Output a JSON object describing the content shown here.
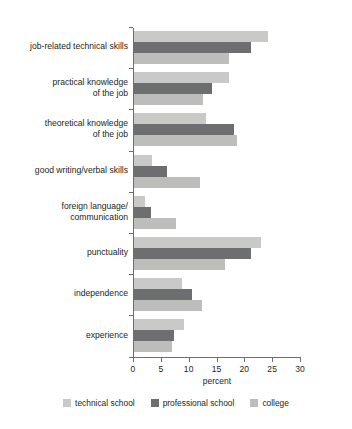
{
  "chart_data": {
    "type": "bar",
    "orientation": "horizontal",
    "title": "",
    "xlabel": "percent",
    "ylabel": "",
    "xlim": [
      0,
      30
    ],
    "xticks": [
      0,
      5,
      10,
      15,
      20,
      25,
      30
    ],
    "xtick_labels": [
      "0",
      "5",
      "10",
      "15",
      "20",
      "25",
      "30"
    ],
    "grid": false,
    "legend_position": "bottom",
    "categories": [
      "job-related technical skills",
      "practical knowledge\nof the job",
      "theoretical knowledge\nof the job",
      "good writing/verbal skills",
      "foreign language/\ncommunication",
      "punctuality",
      "independence",
      "experience"
    ],
    "series": [
      {
        "name": "technical school",
        "color": "#c9c9c7",
        "values": [
          24.0,
          17.0,
          13.0,
          3.2,
          2.0,
          22.8,
          8.6,
          9.0
        ]
      },
      {
        "name": "professional school",
        "color": "#6d6e70",
        "values": [
          21.0,
          14.0,
          18.0,
          5.9,
          3.0,
          21.0,
          10.4,
          7.2
        ]
      },
      {
        "name": "college",
        "color": "#bdbdbb",
        "values": [
          17.0,
          12.4,
          18.5,
          11.8,
          7.5,
          16.3,
          12.2,
          6.8
        ]
      }
    ]
  }
}
